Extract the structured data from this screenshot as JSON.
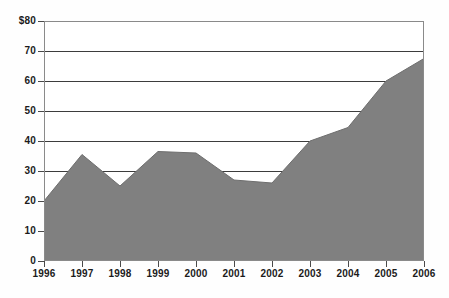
{
  "chart_data": {
    "type": "area",
    "title": "",
    "subtitle": "",
    "xlabel": "",
    "ylabel": "",
    "categories": [
      "1996",
      "1997",
      "1998",
      "1999",
      "2000",
      "2001",
      "2002",
      "2003",
      "2004",
      "2005",
      "2006"
    ],
    "values": [
      20,
      35.5,
      25,
      36.5,
      36,
      27,
      26,
      40,
      44.5,
      60,
      67.5
    ],
    "series": [
      {
        "name": "",
        "values": [
          20,
          35.5,
          25,
          36.5,
          36,
          27,
          26,
          40,
          44.5,
          60,
          67.5
        ]
      }
    ],
    "ylim": [
      0,
      80
    ],
    "y_ticks": [
      0,
      10,
      20,
      30,
      40,
      50,
      60,
      70,
      80
    ],
    "y_tick_labels": [
      "0",
      "10",
      "20",
      "30",
      "40",
      "50",
      "60",
      "70",
      "$80"
    ],
    "x_tick_labels": [
      "1996",
      "1997",
      "1998",
      "1999",
      "2000",
      "2001",
      "2002",
      "2003",
      "2004",
      "2005",
      "2006"
    ],
    "grid": true,
    "grid_axis": "y",
    "legend": false,
    "legend_position": "none",
    "annotations": [],
    "colors": {
      "area_fill": "#808080",
      "area_line": "#6e6e6e",
      "gridline": "#3d3d3d",
      "axis_line": "#555555",
      "plot_border": "#8a8a8a",
      "label_text": "#1b1b1b",
      "background": "#ffffff"
    }
  }
}
